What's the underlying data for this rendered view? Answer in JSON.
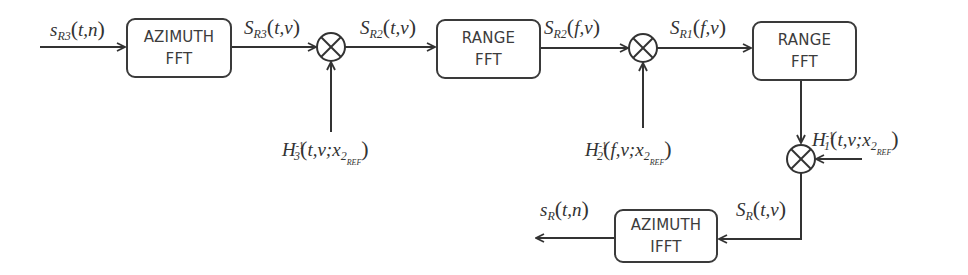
{
  "diagram": {
    "type": "signal-processing-block-diagram",
    "blocks": [
      {
        "id": "b1",
        "line1": "AZIMUTH",
        "line2": "FFT"
      },
      {
        "id": "b2",
        "line1": "RANGE",
        "line2": "FFT"
      },
      {
        "id": "b3",
        "line1": "RANGE",
        "line2": "FFT"
      },
      {
        "id": "b4",
        "line1": "AZIMUTH",
        "line2": "IFFT"
      }
    ],
    "signals": {
      "input": {
        "base": "s",
        "sub": "R3",
        "args": "t,n"
      },
      "s1": {
        "base": "S",
        "sub": "R3",
        "args": "t,ν"
      },
      "s2": {
        "base": "S",
        "sub": "R2",
        "args": "t,ν"
      },
      "s3": {
        "base": "S",
        "sub": "R2",
        "args": "f,ν"
      },
      "s4": {
        "base": "S",
        "sub": "R1",
        "args": "f,ν"
      },
      "s5": {
        "base": "S",
        "sub": "R",
        "args": "t,ν"
      },
      "output": {
        "base": "s",
        "sub": "R",
        "args": "t,n"
      }
    },
    "filters": {
      "h3": {
        "base": "H",
        "sub": "3",
        "sup": "-1",
        "args": "t,ν;x",
        "xsub": "2",
        "xsubsub": "REF"
      },
      "h2": {
        "base": "H",
        "sub": "2",
        "sup": "-1",
        "args": "f,ν;x",
        "xsub": "2",
        "xsubsub": "REF"
      },
      "h1": {
        "base": "H",
        "sub": "1",
        "sup": "-1",
        "args": "t,ν;x",
        "xsub": "2",
        "xsubsub": "REF"
      }
    },
    "multipliers": [
      "multiplier-1",
      "multiplier-2",
      "multiplier-3"
    ]
  }
}
